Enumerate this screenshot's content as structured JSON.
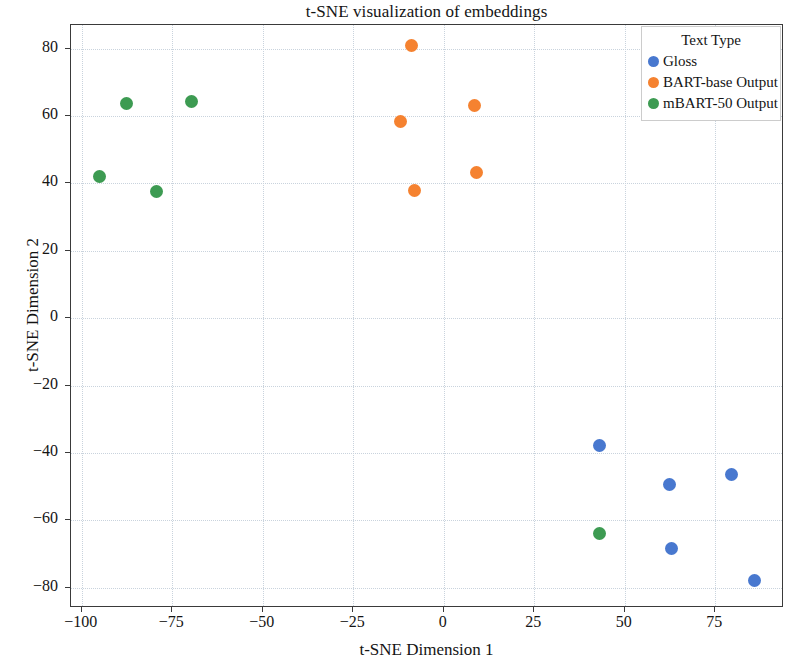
{
  "chart_data": {
    "type": "scatter",
    "title": "t-SNE visualization of embeddings",
    "xlabel": "t-SNE Dimension 1",
    "ylabel": "t-SNE Dimension 2",
    "xlim": [
      -103,
      94
    ],
    "ylim": [
      -86,
      87
    ],
    "xticks": [
      -100,
      -75,
      -50,
      -25,
      0,
      25,
      50,
      75
    ],
    "yticks": [
      80,
      60,
      40,
      20,
      0,
      -20,
      -40,
      -60,
      -80
    ],
    "grid": true,
    "legend": {
      "title": "Text Type",
      "position": "upper right"
    },
    "series": [
      {
        "name": "Gloss",
        "color": "#4878cf",
        "points": [
          {
            "x": 42.9,
            "y": -37.9
          },
          {
            "x": 62.3,
            "y": -49.5
          },
          {
            "x": 79.4,
            "y": -46.5
          },
          {
            "x": 62.8,
            "y": -68.4
          },
          {
            "x": 85.8,
            "y": -77.9
          }
        ]
      },
      {
        "name": "BART-base Output",
        "color": "#f58230",
        "points": [
          {
            "x": -8.9,
            "y": 80.9
          },
          {
            "x": -12.0,
            "y": 58.4
          },
          {
            "x": 8.6,
            "y": 63.1
          },
          {
            "x": 9.1,
            "y": 43.3
          },
          {
            "x": -8.0,
            "y": 37.8
          }
        ]
      },
      {
        "name": "mBART-50 Output",
        "color": "#3d9b52",
        "points": [
          {
            "x": -87.7,
            "y": 63.7
          },
          {
            "x": -69.7,
            "y": 64.4
          },
          {
            "x": -95.2,
            "y": 41.9
          },
          {
            "x": -79.4,
            "y": 37.5
          },
          {
            "x": 42.9,
            "y": -63.9
          }
        ]
      }
    ]
  }
}
